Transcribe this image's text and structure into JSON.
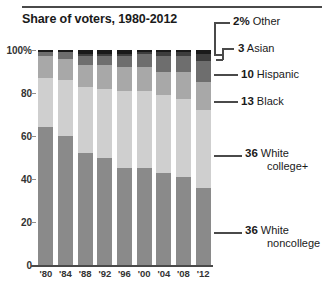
{
  "chart_data": {
    "type": "bar",
    "subtype": "stacked-bar-100pct",
    "title": "Share of voters, 1980-2012",
    "xlabel": "",
    "ylabel": "",
    "ylim": [
      0,
      100
    ],
    "ytick_labels": [
      "100%",
      "80",
      "60",
      "40",
      "20",
      "0"
    ],
    "ytick_values": [
      100,
      80,
      60,
      40,
      20,
      0
    ],
    "grid": false,
    "legend_position": "right",
    "categories": [
      "'80",
      "'84",
      "'88",
      "'92",
      "'96",
      "'00",
      "'04",
      "'08",
      "'12"
    ],
    "stack_order_bottom_to_top": [
      "White noncollege",
      "White college+",
      "Black",
      "Hispanic",
      "Asian",
      "Other"
    ],
    "series": [
      {
        "name": "White noncollege",
        "color": "#8a8a8a",
        "values": [
          64,
          60,
          52,
          50,
          45,
          45,
          43,
          41,
          36
        ]
      },
      {
        "name": "White college+",
        "color": "#cfcfcf",
        "values": [
          23,
          26,
          31,
          32,
          36,
          36,
          36,
          36,
          36
        ]
      },
      {
        "name": "Black",
        "color": "#a8a8a8",
        "values": [
          10,
          10,
          10,
          11,
          11,
          11,
          11,
          13,
          13
        ]
      },
      {
        "name": "Hispanic",
        "color": "#6e6e6e",
        "values": [
          2,
          3,
          4,
          4,
          5,
          6,
          7,
          7,
          10
        ]
      },
      {
        "name": "Asian",
        "color": "#3d3d3d",
        "values": [
          0,
          0,
          1,
          1,
          1,
          1,
          2,
          2,
          3
        ]
      },
      {
        "name": "Other",
        "color": "#1a1a1a",
        "values": [
          1,
          1,
          2,
          2,
          2,
          1,
          1,
          1,
          2
        ]
      }
    ],
    "annotations": [
      {
        "value": "2%",
        "label": "Other",
        "series": "Other"
      },
      {
        "value": "3",
        "label": "Asian",
        "series": "Asian"
      },
      {
        "value": "10",
        "label": "Hispanic",
        "series": "Hispanic"
      },
      {
        "value": "13",
        "label": "Black",
        "series": "Black"
      },
      {
        "value": "36",
        "label": "White college+",
        "series": "White college+"
      },
      {
        "value": "36",
        "label": "White noncollege",
        "series": "White noncollege"
      }
    ]
  },
  "legend": {
    "other": {
      "value": "2%",
      "label": "Other"
    },
    "asian": {
      "value": "3",
      "label": "Asian"
    },
    "hispanic": {
      "value": "10",
      "label": "Hispanic"
    },
    "black": {
      "value": "13",
      "label": "Black"
    },
    "whitecol": {
      "value": "36",
      "label_line1": "White",
      "label_line2": "college+"
    },
    "whitenon": {
      "value": "36",
      "label_line1": "White",
      "label_line2": "noncollege"
    }
  },
  "yaxis": {
    "t0": "100%",
    "t1": "80",
    "t2": "60",
    "t3": "40",
    "t4": "20",
    "t5": "0"
  },
  "xaxis": {
    "t0": "'80",
    "t1": "'84",
    "t2": "'88",
    "t3": "'92",
    "t4": "'96",
    "t5": "'00",
    "t6": "'04",
    "t7": "'08",
    "t8": "'12"
  },
  "header": {
    "title": "Share of voters, 1980-2012"
  }
}
